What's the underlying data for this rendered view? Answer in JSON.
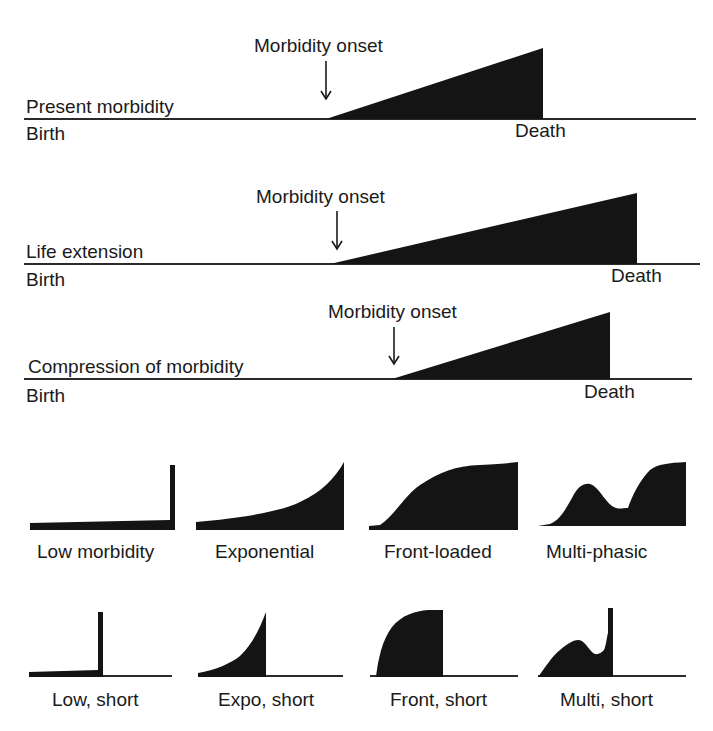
{
  "scenarios": [
    {
      "id": "present-morbidity",
      "label": "Present morbidity",
      "onset_label": "Morbidity onset",
      "birth_label": "Birth",
      "death_label": "Death"
    },
    {
      "id": "life-extension",
      "label": "Life extension",
      "onset_label": "Morbidity onset",
      "birth_label": "Birth",
      "death_label": "Death"
    },
    {
      "id": "compression-of-morbidity",
      "label": "Compression of morbidity",
      "onset_label": "Morbidity onset",
      "birth_label": "Birth",
      "death_label": "Death"
    }
  ],
  "shapes_row1": [
    {
      "label": "Low morbidity"
    },
    {
      "label": "Exponential"
    },
    {
      "label": "Front-loaded"
    },
    {
      "label": "Multi-phasic"
    }
  ],
  "shapes_row2": [
    {
      "label": "Low, short"
    },
    {
      "label": "Expo, short"
    },
    {
      "label": "Front, short"
    },
    {
      "label": "Multi, short"
    }
  ],
  "colors": {
    "fill": "#141414",
    "line": "#2a2a2a",
    "background": "#ffffff"
  }
}
